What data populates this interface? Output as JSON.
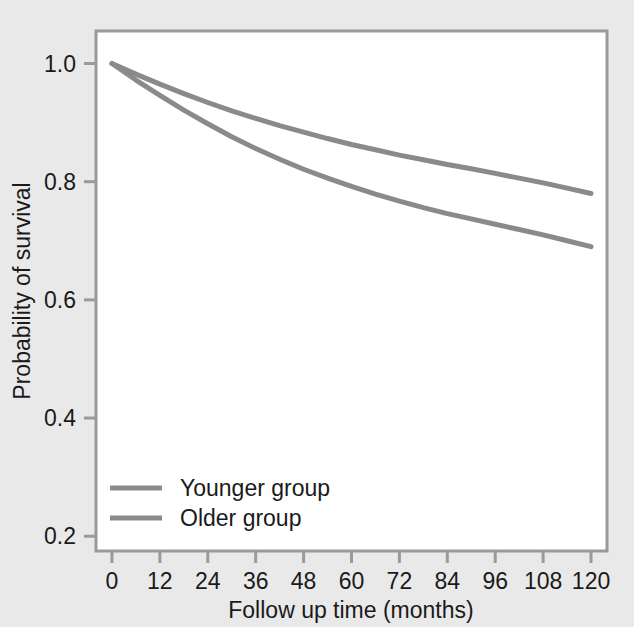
{
  "chart_data": {
    "type": "line",
    "title": "",
    "subtitle": "",
    "xlabel": "Follow up time (months)",
    "ylabel": "Probability of survival",
    "xlim": [
      -4,
      124
    ],
    "ylim": [
      0.175,
      1.055
    ],
    "xticks": [
      0,
      12,
      24,
      36,
      48,
      60,
      72,
      84,
      96,
      108,
      120
    ],
    "xtick_labels": [
      "0",
      "12",
      "24",
      "36",
      "48",
      "60",
      "72",
      "84",
      "96",
      "108",
      "120"
    ],
    "yticks": [
      0.2,
      0.4,
      0.6,
      0.8,
      1.0
    ],
    "ytick_labels": [
      "0.2",
      "0.4",
      "0.6",
      "0.8",
      "1.0"
    ],
    "grid": false,
    "legend_position": "lower left inside",
    "line_color": "#8a8a8a",
    "frame_color": "#9a9a9a",
    "plot_background": "#ffffff",
    "figure_background": "#e9e9e9",
    "x": [
      0,
      6,
      12,
      18,
      24,
      30,
      36,
      42,
      48,
      54,
      60,
      66,
      72,
      78,
      84,
      90,
      96,
      102,
      108,
      114,
      120
    ],
    "series": [
      {
        "name": "Younger group",
        "values": [
          1.0,
          0.982,
          0.965,
          0.949,
          0.934,
          0.92,
          0.907,
          0.895,
          0.884,
          0.873,
          0.863,
          0.854,
          0.845,
          0.837,
          0.829,
          0.822,
          0.814,
          0.806,
          0.798,
          0.789,
          0.78
        ]
      },
      {
        "name": "Older group",
        "values": [
          1.0,
          0.972,
          0.946,
          0.921,
          0.898,
          0.876,
          0.856,
          0.838,
          0.821,
          0.806,
          0.792,
          0.779,
          0.767,
          0.756,
          0.746,
          0.737,
          0.728,
          0.719,
          0.71,
          0.7,
          0.69
        ]
      }
    ]
  },
  "legend": {
    "entries": [
      {
        "label": "Younger group"
      },
      {
        "label": "Older group"
      }
    ]
  }
}
